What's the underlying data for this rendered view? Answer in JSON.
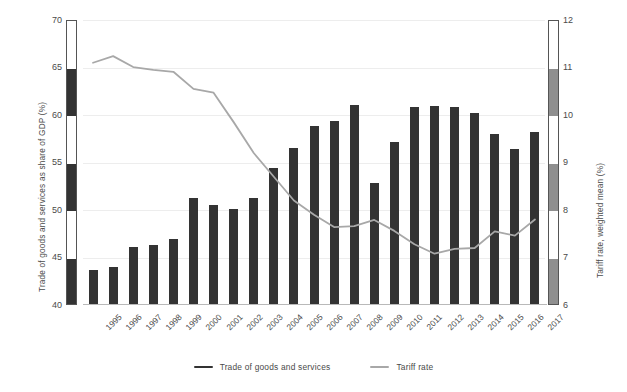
{
  "chart_data": {
    "type": "bar",
    "title": "",
    "subtitle": "",
    "xlabel": "",
    "ylabel": "Trade of goods and services as share of GDP (%)",
    "y2label": "Tariff rate, weighted mean (%)",
    "grid": true,
    "legend_position": "bottom-center",
    "categories": [
      "1995",
      "1996",
      "1997",
      "1998",
      "1999",
      "2000",
      "2001",
      "2002",
      "2003",
      "2004",
      "2005",
      "2006",
      "2007",
      "2008",
      "2009",
      "2010",
      "2011",
      "2012",
      "2013",
      "2014",
      "2015",
      "2016",
      "2017"
    ],
    "ylim": [
      40,
      70
    ],
    "yticks": [
      40,
      45,
      50,
      55,
      60,
      65,
      70
    ],
    "y2lim": [
      6,
      12
    ],
    "y2ticks": [
      6,
      7,
      8,
      9,
      10,
      11,
      12
    ],
    "series": [
      {
        "name": "Trade of goods and services",
        "type": "bar",
        "axis": "left",
        "color": "#333333",
        "values": [
          43.7,
          44.0,
          46.1,
          46.3,
          47.0,
          51.3,
          50.5,
          50.1,
          51.3,
          54.4,
          56.5,
          58.8,
          59.4,
          61.1,
          52.8,
          57.2,
          60.8,
          60.9,
          60.8,
          60.2,
          58.0,
          56.4,
          58.2
        ]
      },
      {
        "name": "Tariff rate",
        "type": "line",
        "axis": "right",
        "color": "#a8a8a8",
        "values": [
          11.1,
          11.24,
          11.01,
          10.95,
          10.91,
          10.55,
          10.47,
          9.85,
          9.2,
          8.7,
          8.2,
          7.9,
          7.64,
          7.66,
          7.79,
          7.56,
          7.28,
          7.08,
          7.18,
          7.2,
          7.55,
          7.46,
          7.8
        ]
      }
    ]
  },
  "legend": {
    "items": [
      {
        "label": "Trade of goods and services",
        "color": "#333333"
      },
      {
        "label": "Tariff rate",
        "color": "#a8a8a8"
      }
    ]
  }
}
